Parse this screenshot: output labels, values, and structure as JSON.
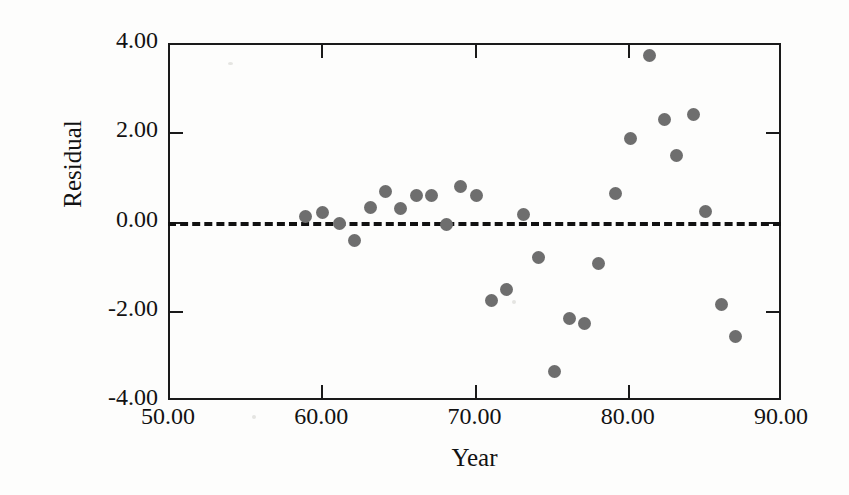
{
  "chart_data": {
    "type": "scatter",
    "title": "",
    "xlabel": "Year",
    "ylabel": "Residual",
    "xlim": [
      50.0,
      90.0
    ],
    "ylim": [
      -4.0,
      4.0
    ],
    "grid": false,
    "legend": null,
    "xticks": [
      50.0,
      60.0,
      70.0,
      80.0,
      90.0
    ],
    "xtick_labels": [
      "50.00",
      "60.00",
      "70.00",
      "80.00",
      "90.00"
    ],
    "yticks": [
      4.0,
      2.0,
      0.0,
      -2.0,
      -4.0
    ],
    "ytick_labels": [
      "4.00",
      "2.00",
      "0.00",
      "-2.00",
      "-4.00"
    ],
    "marker": {
      "shape": "circle",
      "color": "#6e6e6e",
      "size_px": 13
    },
    "reference_line": {
      "y": 0.0,
      "style": "dashed",
      "color": "#111111"
    },
    "points": [
      {
        "x": 59.0,
        "y": 0.12
      },
      {
        "x": 60.1,
        "y": 0.2
      },
      {
        "x": 61.2,
        "y": -0.04
      },
      {
        "x": 62.2,
        "y": -0.43
      },
      {
        "x": 63.2,
        "y": 0.32
      },
      {
        "x": 64.2,
        "y": 0.68
      },
      {
        "x": 65.2,
        "y": 0.29
      },
      {
        "x": 66.2,
        "y": 0.58
      },
      {
        "x": 67.2,
        "y": 0.58
      },
      {
        "x": 68.2,
        "y": -0.06
      },
      {
        "x": 69.1,
        "y": 0.78
      },
      {
        "x": 70.1,
        "y": 0.58
      },
      {
        "x": 71.1,
        "y": -1.77
      },
      {
        "x": 72.1,
        "y": -1.53
      },
      {
        "x": 73.2,
        "y": 0.15
      },
      {
        "x": 74.2,
        "y": -0.8
      },
      {
        "x": 75.2,
        "y": -3.36
      },
      {
        "x": 76.2,
        "y": -2.18
      },
      {
        "x": 77.2,
        "y": -2.28
      },
      {
        "x": 78.1,
        "y": -0.93
      },
      {
        "x": 79.2,
        "y": 0.63
      },
      {
        "x": 80.2,
        "y": 1.86
      },
      {
        "x": 81.4,
        "y": 3.72
      },
      {
        "x": 82.4,
        "y": 2.28
      },
      {
        "x": 83.2,
        "y": 1.49
      },
      {
        "x": 84.3,
        "y": 2.39
      },
      {
        "x": 85.1,
        "y": 0.22
      },
      {
        "x": 86.1,
        "y": -1.85
      },
      {
        "x": 87.0,
        "y": -2.58
      }
    ]
  }
}
